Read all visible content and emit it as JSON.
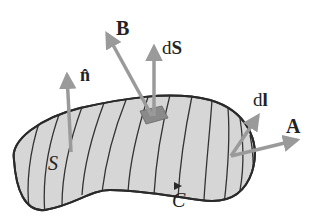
{
  "diagram": {
    "labels": {
      "B": "B",
      "dS_d": "d",
      "dS_S": "S",
      "n_hat": "n̂",
      "dl_d": "d",
      "dl_l": "l",
      "A": "A",
      "S": "S",
      "C": "C"
    },
    "colors": {
      "surface_fill": "#d6d6d6",
      "outline": "#2a2a2a",
      "arrow": "#9a9a9a",
      "patch": "#8a8a8a",
      "text": "#222222"
    }
  }
}
